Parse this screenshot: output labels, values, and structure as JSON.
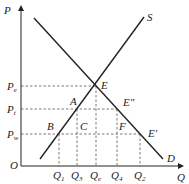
{
  "diagram": {
    "axes": {
      "y_label": "P",
      "x_label": "Q",
      "origin_label": "O"
    },
    "curves": {
      "supply_label": "S",
      "demand_label": "D"
    },
    "price_levels": [
      {
        "main": "P",
        "sub": "e"
      },
      {
        "main": "P",
        "sub": "t"
      },
      {
        "main": "P",
        "sub": "w"
      }
    ],
    "quantity_levels": [
      {
        "main": "Q",
        "sub": "1"
      },
      {
        "main": "Q",
        "sub": "3"
      },
      {
        "main": "Q",
        "sub": "e"
      },
      {
        "main": "Q",
        "sub": "4"
      },
      {
        "main": "Q",
        "sub": "2"
      }
    ],
    "points": {
      "E": "E",
      "A": "A",
      "B": "B",
      "C": "C",
      "F": "F",
      "E_double_prime": "E\"",
      "E_prime": "E'"
    },
    "colors": {
      "line": "#222222",
      "dashed": "#555555"
    }
  }
}
